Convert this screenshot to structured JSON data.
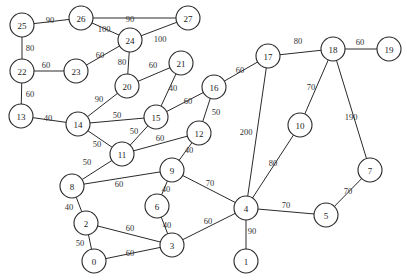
{
  "diagram": {
    "type": "weighted-undirected-graph",
    "node_radius": 12,
    "colors": {
      "stroke": "#2a2a2a",
      "fill": "#ffffff",
      "text": "#222222"
    },
    "nodes": [
      {
        "id": "0",
        "x": 94,
        "y": 261
      },
      {
        "id": "1",
        "x": 246,
        "y": 261
      },
      {
        "id": "2",
        "x": 86,
        "y": 223
      },
      {
        "id": "3",
        "x": 172,
        "y": 245
      },
      {
        "id": "4",
        "x": 246,
        "y": 208
      },
      {
        "id": "5",
        "x": 326,
        "y": 215
      },
      {
        "id": "6",
        "x": 157,
        "y": 206
      },
      {
        "id": "7",
        "x": 370,
        "y": 170
      },
      {
        "id": "8",
        "x": 72,
        "y": 186
      },
      {
        "id": "9",
        "x": 172,
        "y": 170
      },
      {
        "id": "10",
        "x": 300,
        "y": 125
      },
      {
        "id": "11",
        "x": 122,
        "y": 154
      },
      {
        "id": "12",
        "x": 199,
        "y": 133
      },
      {
        "id": "13",
        "x": 21,
        "y": 116
      },
      {
        "id": "14",
        "x": 78,
        "y": 124
      },
      {
        "id": "15",
        "x": 156,
        "y": 117
      },
      {
        "id": "16",
        "x": 214,
        "y": 87
      },
      {
        "id": "17",
        "x": 268,
        "y": 56
      },
      {
        "id": "18",
        "x": 333,
        "y": 49
      },
      {
        "id": "19",
        "x": 389,
        "y": 49
      },
      {
        "id": "20",
        "x": 127,
        "y": 86
      },
      {
        "id": "21",
        "x": 181,
        "y": 63
      },
      {
        "id": "22",
        "x": 22,
        "y": 71
      },
      {
        "id": "23",
        "x": 76,
        "y": 71
      },
      {
        "id": "24",
        "x": 130,
        "y": 40
      },
      {
        "id": "25",
        "x": 22,
        "y": 25
      },
      {
        "id": "26",
        "x": 81,
        "y": 18
      },
      {
        "id": "27",
        "x": 188,
        "y": 18
      }
    ],
    "edges": [
      {
        "from": "25",
        "to": "26",
        "weight": "90",
        "lx": 50,
        "ly": 20
      },
      {
        "from": "26",
        "to": "27",
        "weight": "90",
        "lx": 130,
        "ly": 19
      },
      {
        "from": "26",
        "to": "24",
        "weight": "100",
        "lx": 104,
        "ly": 29
      },
      {
        "from": "27",
        "to": "24",
        "weight": "100",
        "lx": 160,
        "ly": 39
      },
      {
        "from": "25",
        "to": "22",
        "weight": "80",
        "lx": 30,
        "ly": 48
      },
      {
        "from": "22",
        "to": "23",
        "weight": "60",
        "lx": 46,
        "ly": 65
      },
      {
        "from": "23",
        "to": "24",
        "weight": "60",
        "lx": 100,
        "ly": 55
      },
      {
        "from": "24",
        "to": "20",
        "weight": "80",
        "lx": 122,
        "ly": 62
      },
      {
        "from": "20",
        "to": "21",
        "weight": "60",
        "lx": 153,
        "ly": 65
      },
      {
        "from": "22",
        "to": "13",
        "weight": "60",
        "lx": 30,
        "ly": 94
      },
      {
        "from": "13",
        "to": "14",
        "weight": "40",
        "lx": 48,
        "ly": 118
      },
      {
        "from": "14",
        "to": "20",
        "weight": "90",
        "lx": 99,
        "ly": 99
      },
      {
        "from": "14",
        "to": "15",
        "weight": "50",
        "lx": 117,
        "ly": 115
      },
      {
        "from": "21",
        "to": "15",
        "weight": "40",
        "lx": 173,
        "ly": 88
      },
      {
        "from": "15",
        "to": "16",
        "weight": "60",
        "lx": 188,
        "ly": 101
      },
      {
        "from": "15",
        "to": "11",
        "weight": "50",
        "lx": 134,
        "ly": 131
      },
      {
        "from": "14",
        "to": "11",
        "weight": "50",
        "lx": 97,
        "ly": 144
      },
      {
        "from": "16",
        "to": "12",
        "weight": "50",
        "lx": 216,
        "ly": 112
      },
      {
        "from": "16",
        "to": "17",
        "weight": "60",
        "lx": 240,
        "ly": 70
      },
      {
        "from": "11",
        "to": "12",
        "weight": "60",
        "lx": 160,
        "ly": 138
      },
      {
        "from": "12",
        "to": "9",
        "weight": "40",
        "lx": 189,
        "ly": 150
      },
      {
        "from": "11",
        "to": "8",
        "weight": "50",
        "lx": 87,
        "ly": 162
      },
      {
        "from": "8",
        "to": "9",
        "weight": "60",
        "lx": 119,
        "ly": 184
      },
      {
        "from": "9",
        "to": "4",
        "weight": "70",
        "lx": 210,
        "ly": 183
      },
      {
        "from": "9",
        "to": "6",
        "weight": "40",
        "lx": 166,
        "ly": 189
      },
      {
        "from": "6",
        "to": "3",
        "weight": "40",
        "lx": 167,
        "ly": 225
      },
      {
        "from": "8",
        "to": "2",
        "weight": "40",
        "lx": 69,
        "ly": 207
      },
      {
        "from": "2",
        "to": "3",
        "weight": "60",
        "lx": 130,
        "ly": 228
      },
      {
        "from": "2",
        "to": "0",
        "weight": "50",
        "lx": 80,
        "ly": 243
      },
      {
        "from": "0",
        "to": "3",
        "weight": "60",
        "lx": 130,
        "ly": 253
      },
      {
        "from": "3",
        "to": "4",
        "weight": "60",
        "lx": 208,
        "ly": 221
      },
      {
        "from": "4",
        "to": "1",
        "weight": "90",
        "lx": 252,
        "ly": 231
      },
      {
        "from": "4",
        "to": "5",
        "weight": "70",
        "lx": 286,
        "ly": 205
      },
      {
        "from": "4",
        "to": "17",
        "weight": "200",
        "lx": 246,
        "ly": 132
      },
      {
        "from": "4",
        "to": "10",
        "weight": "80",
        "lx": 273,
        "ly": 163
      },
      {
        "from": "17",
        "to": "18",
        "weight": "80",
        "lx": 298,
        "ly": 41
      },
      {
        "from": "18",
        "to": "19",
        "weight": "60",
        "lx": 360,
        "ly": 42
      },
      {
        "from": "18",
        "to": "10",
        "weight": "70",
        "lx": 311,
        "ly": 87
      },
      {
        "from": "18",
        "to": "7",
        "weight": "190",
        "lx": 351,
        "ly": 117
      },
      {
        "from": "7",
        "to": "5",
        "weight": "70",
        "lx": 348,
        "ly": 191
      }
    ]
  }
}
